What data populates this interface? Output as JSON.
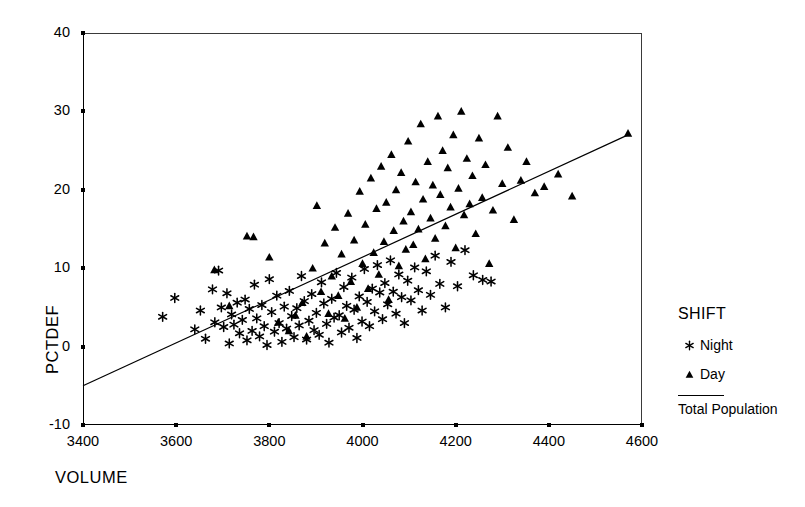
{
  "chart_data": {
    "type": "scatter",
    "title": "",
    "xlabel": "VOLUME",
    "ylabel": "PCTDEF",
    "xlim": [
      3400,
      4600
    ],
    "ylim": [
      -10,
      40
    ],
    "xticks": [
      3400,
      3600,
      3800,
      4000,
      4200,
      4400,
      4600
    ],
    "yticks": [
      40,
      30,
      20,
      10,
      0,
      -10
    ],
    "grid": false,
    "legend": {
      "title": "SHIFT",
      "position": "right",
      "entries": [
        {
          "label": "Night",
          "marker": "asterisk"
        },
        {
          "label": "Day",
          "marker": "triangle"
        },
        {
          "label": "Total Population",
          "marker": "line"
        }
      ]
    },
    "fit_line": {
      "name": "Total Population",
      "x": [
        3400,
        4570
      ],
      "y": [
        -5.0,
        27.0
      ],
      "slope": 0.02735,
      "intercept": -98.0
    },
    "series": [
      {
        "name": "Night",
        "marker": "asterisk",
        "color": "#000000",
        "points": [
          [
            3571,
            3.8
          ],
          [
            3597,
            6.2
          ],
          [
            3640,
            2.2
          ],
          [
            3652,
            4.6
          ],
          [
            3663,
            1.0
          ],
          [
            3678,
            7.3
          ],
          [
            3683,
            3.1
          ],
          [
            3691,
            9.7
          ],
          [
            3697,
            5.0
          ],
          [
            3702,
            2.5
          ],
          [
            3709,
            6.8
          ],
          [
            3714,
            0.4
          ],
          [
            3719,
            4.1
          ],
          [
            3724,
            2.8
          ],
          [
            3731,
            5.6
          ],
          [
            3736,
            1.7
          ],
          [
            3742,
            3.4
          ],
          [
            3748,
            6.0
          ],
          [
            3752,
            0.8
          ],
          [
            3757,
            4.8
          ],
          [
            3763,
            2.0
          ],
          [
            3768,
            7.9
          ],
          [
            3773,
            3.6
          ],
          [
            3779,
            1.3
          ],
          [
            3784,
            5.3
          ],
          [
            3789,
            2.6
          ],
          [
            3795,
            0.2
          ],
          [
            3800,
            8.6
          ],
          [
            3805,
            4.4
          ],
          [
            3811,
            1.9
          ],
          [
            3816,
            6.5
          ],
          [
            3821,
            3.0
          ],
          [
            3827,
            0.6
          ],
          [
            3832,
            5.1
          ],
          [
            3837,
            2.3
          ],
          [
            3843,
            7.1
          ],
          [
            3848,
            3.9
          ],
          [
            3853,
            1.2
          ],
          [
            3859,
            4.9
          ],
          [
            3864,
            2.7
          ],
          [
            3869,
            9.0
          ],
          [
            3875,
            5.8
          ],
          [
            3880,
            0.9
          ],
          [
            3885,
            3.3
          ],
          [
            3891,
            6.7
          ],
          [
            3896,
            2.1
          ],
          [
            3901,
            4.3
          ],
          [
            3907,
            1.5
          ],
          [
            3912,
            8.2
          ],
          [
            3917,
            5.5
          ],
          [
            3923,
            2.9
          ],
          [
            3928,
            0.5
          ],
          [
            3934,
            6.1
          ],
          [
            3939,
            3.7
          ],
          [
            3944,
            9.4
          ],
          [
            3950,
            4.0
          ],
          [
            3955,
            1.8
          ],
          [
            3960,
            7.6
          ],
          [
            3966,
            5.2
          ],
          [
            3971,
            2.4
          ],
          [
            3977,
            8.8
          ],
          [
            3982,
            4.7
          ],
          [
            3988,
            1.1
          ],
          [
            3993,
            6.4
          ],
          [
            3999,
            3.2
          ],
          [
            4004,
            9.9
          ],
          [
            4010,
            5.7
          ],
          [
            4015,
            2.6
          ],
          [
            4021,
            7.4
          ],
          [
            4026,
            4.5
          ],
          [
            4032,
            10.4
          ],
          [
            4037,
            6.9
          ],
          [
            4043,
            3.5
          ],
          [
            4048,
            8.1
          ],
          [
            4054,
            5.4
          ],
          [
            4060,
            11.0
          ],
          [
            4066,
            7.0
          ],
          [
            4072,
            4.2
          ],
          [
            4078,
            9.2
          ],
          [
            4084,
            6.3
          ],
          [
            4090,
            3.0
          ],
          [
            4097,
            8.4
          ],
          [
            4104,
            5.9
          ],
          [
            4112,
            10.1
          ],
          [
            4120,
            7.2
          ],
          [
            4128,
            4.6
          ],
          [
            4137,
            9.6
          ],
          [
            4146,
            6.6
          ],
          [
            4156,
            11.6
          ],
          [
            4166,
            8.0
          ],
          [
            4178,
            5.0
          ],
          [
            4190,
            10.8
          ],
          [
            4204,
            7.7
          ],
          [
            4220,
            12.3
          ],
          [
            4238,
            9.1
          ],
          [
            4258,
            8.5
          ],
          [
            4276,
            8.3
          ]
        ]
      },
      {
        "name": "Day",
        "marker": "triangle",
        "color": "#000000",
        "points": [
          [
            3682,
            9.8
          ],
          [
            3714,
            5.2
          ],
          [
            3752,
            14.1
          ],
          [
            3766,
            14.0
          ],
          [
            3800,
            11.4
          ],
          [
            3819,
            3.1
          ],
          [
            3842,
            2.0
          ],
          [
            3856,
            4.0
          ],
          [
            3871,
            5.6
          ],
          [
            3880,
            1.3
          ],
          [
            3893,
            10.0
          ],
          [
            3902,
            18.0
          ],
          [
            3911,
            7.0
          ],
          [
            3919,
            13.2
          ],
          [
            3927,
            4.2
          ],
          [
            3934,
            9.0
          ],
          [
            3941,
            15.2
          ],
          [
            3948,
            6.5
          ],
          [
            3955,
            11.8
          ],
          [
            3962,
            3.6
          ],
          [
            3969,
            17.0
          ],
          [
            3975,
            8.3
          ],
          [
            3982,
            13.6
          ],
          [
            3988,
            5.0
          ],
          [
            3994,
            19.8
          ],
          [
            4000,
            10.6
          ],
          [
            4006,
            15.6
          ],
          [
            4012,
            7.4
          ],
          [
            4018,
            21.5
          ],
          [
            4024,
            12.0
          ],
          [
            4030,
            17.6
          ],
          [
            4035,
            9.2
          ],
          [
            4040,
            23.0
          ],
          [
            4046,
            13.4
          ],
          [
            4051,
            18.4
          ],
          [
            4056,
            6.0
          ],
          [
            4062,
            24.5
          ],
          [
            4067,
            14.8
          ],
          [
            4072,
            20.0
          ],
          [
            4078,
            10.3
          ],
          [
            4083,
            22.2
          ],
          [
            4088,
            16.0
          ],
          [
            4093,
            12.4
          ],
          [
            4098,
            26.2
          ],
          [
            4104,
            17.2
          ],
          [
            4109,
            13.0
          ],
          [
            4114,
            21.0
          ],
          [
            4120,
            15.0
          ],
          [
            4125,
            28.4
          ],
          [
            4130,
            18.8
          ],
          [
            4135,
            11.2
          ],
          [
            4140,
            23.6
          ],
          [
            4146,
            16.4
          ],
          [
            4151,
            20.6
          ],
          [
            4156,
            13.8
          ],
          [
            4162,
            29.4
          ],
          [
            4167,
            19.4
          ],
          [
            4172,
            25.0
          ],
          [
            4178,
            15.4
          ],
          [
            4183,
            22.8
          ],
          [
            4189,
            17.8
          ],
          [
            4195,
            27.0
          ],
          [
            4200,
            12.6
          ],
          [
            4206,
            20.2
          ],
          [
            4212,
            30.0
          ],
          [
            4218,
            16.8
          ],
          [
            4224,
            24.0
          ],
          [
            4230,
            18.2
          ],
          [
            4236,
            21.8
          ],
          [
            4243,
            14.4
          ],
          [
            4250,
            26.6
          ],
          [
            4257,
            19.0
          ],
          [
            4264,
            23.2
          ],
          [
            4272,
            10.6
          ],
          [
            4280,
            17.4
          ],
          [
            4290,
            29.4
          ],
          [
            4300,
            20.8
          ],
          [
            4312,
            25.4
          ],
          [
            4325,
            16.2
          ],
          [
            4340,
            21.2
          ],
          [
            4352,
            23.6
          ],
          [
            4370,
            19.6
          ],
          [
            4390,
            20.4
          ],
          [
            4420,
            22.0
          ],
          [
            4450,
            19.2
          ],
          [
            4570,
            27.2
          ]
        ]
      }
    ]
  }
}
